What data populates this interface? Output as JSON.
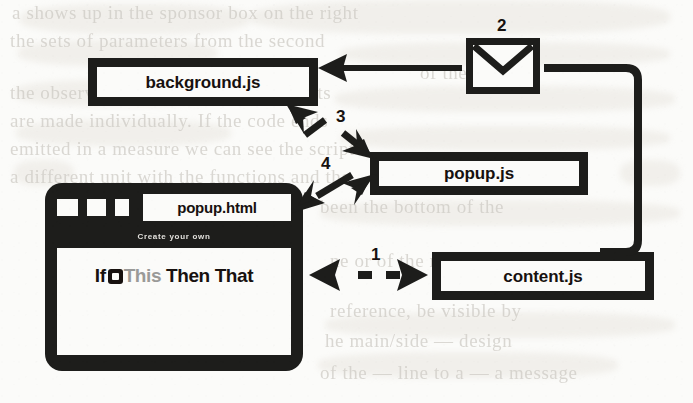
{
  "figure": {
    "type": "architecture-diagram",
    "background_color": "#fbfbf9",
    "ink_color": "#1d1d1b"
  },
  "nodes": {
    "background_js": {
      "label": "background.js",
      "shape": "box"
    },
    "popup_js": {
      "label": "popup.js",
      "shape": "box"
    },
    "content_js": {
      "label": "content.js",
      "shape": "box"
    },
    "message": {
      "label": "",
      "shape": "envelope",
      "icon": "envelope-icon"
    },
    "popup_html": {
      "label": "popup.html",
      "shape": "browser-tab"
    }
  },
  "browser": {
    "tab_label": "popup.html",
    "tab_squares": [
      "",
      "",
      ""
    ],
    "page": {
      "header_text": "Create your own",
      "tagline_prefix": "If",
      "tagline_this": "This",
      "tagline_suffix": "Then That",
      "glyph": "ifttt-square-icon"
    }
  },
  "steps": [
    {
      "number": "1",
      "from": "popup.html",
      "to": "content.js",
      "style": "dashed",
      "heads": "both"
    },
    {
      "number": "2",
      "from": "envelope",
      "to": "background.js",
      "style": "solid",
      "heads": "single"
    },
    {
      "number": "3",
      "from": "background.js",
      "to": "popup.js",
      "style": "dashed",
      "heads": "both"
    },
    {
      "number": "4",
      "from": "popup.html",
      "to": "popup.js",
      "style": "solid",
      "heads": "both"
    }
  ],
  "step_labels": {
    "one": "1",
    "two": "2",
    "three": "3",
    "four": "4"
  }
}
